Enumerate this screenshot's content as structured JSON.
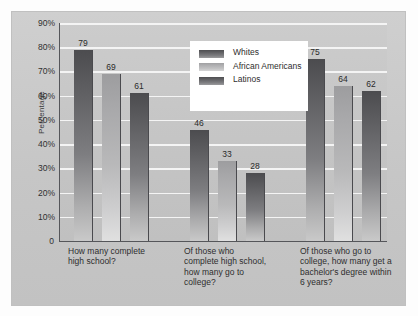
{
  "chart_data": {
    "type": "bar",
    "title": "",
    "subtitle": "",
    "xlabel": "",
    "ylabel": "Percentage",
    "ylim": [
      0,
      90
    ],
    "ytick_labels": [
      "90%",
      "80%",
      "70%",
      "60%",
      "50%",
      "40%",
      "30%",
      "20%",
      "10%",
      "0"
    ],
    "ytick_values": [
      90,
      80,
      70,
      60,
      50,
      40,
      30,
      20,
      10,
      0
    ],
    "grid": true,
    "legend_position": "top-center",
    "categories": [
      "How many complete high school?",
      "Of those who complete high school, how many go to college?",
      "Of those who go to college, how many get a bachelor's degree within 6 years?"
    ],
    "series": [
      {
        "name": "Whites",
        "values": [
          79,
          46,
          75
        ],
        "color": "#5c5c5f"
      },
      {
        "name": "African Americans",
        "values": [
          69,
          33,
          64
        ],
        "color": "#b0b0b2"
      },
      {
        "name": "Latinos",
        "values": [
          61,
          28,
          62
        ],
        "color": "#5c5c5f"
      }
    ]
  },
  "legend": {
    "items": [
      {
        "label": "Whites",
        "shade": "dark"
      },
      {
        "label": "African Americans",
        "shade": "light"
      },
      {
        "label": "Latinos",
        "shade": "dark"
      }
    ]
  },
  "axis": {
    "y_title": "Percentage",
    "ticks": [
      "90%",
      "80%",
      "70%",
      "60%",
      "50%",
      "40%",
      "30%",
      "20%",
      "10%",
      "0"
    ]
  },
  "categories": [
    {
      "label": "How many complete high school?"
    },
    {
      "label": "Of those who complete high school, how many go to college?"
    },
    {
      "label": "Of those who go to college, how many get a bachelor's degree within 6 years?"
    }
  ],
  "values": {
    "g0": [
      "79",
      "69",
      "61"
    ],
    "g1": [
      "46",
      "33",
      "28"
    ],
    "g2": [
      "75",
      "64",
      "62"
    ]
  }
}
